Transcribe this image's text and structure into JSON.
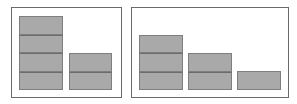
{
  "diagram": {
    "type": "stacked-block-comparison",
    "colors": {
      "frame": "#6a6a6a",
      "block_fill": "#a9a9a9",
      "block_border": "#7e7e7e",
      "background": "#ffffff"
    },
    "panels": [
      {
        "name": "left-panel",
        "frame": {
          "x": 11,
          "y": 7,
          "w": 111,
          "h": 91
        },
        "stacks": [
          {
            "x": 19,
            "y": 16,
            "w": 44,
            "h": 74,
            "segments": 4
          },
          {
            "x": 69,
            "y": 53,
            "w": 43,
            "h": 37,
            "segments": 2
          }
        ]
      },
      {
        "name": "right-panel",
        "frame": {
          "x": 131,
          "y": 7,
          "w": 158,
          "h": 91
        },
        "stacks": [
          {
            "x": 139,
            "y": 35,
            "w": 44,
            "h": 55,
            "segments": 3
          },
          {
            "x": 188,
            "y": 53,
            "w": 44,
            "h": 37,
            "segments": 2
          },
          {
            "x": 237,
            "y": 71,
            "w": 44,
            "h": 19,
            "segments": 1
          }
        ]
      }
    ]
  }
}
